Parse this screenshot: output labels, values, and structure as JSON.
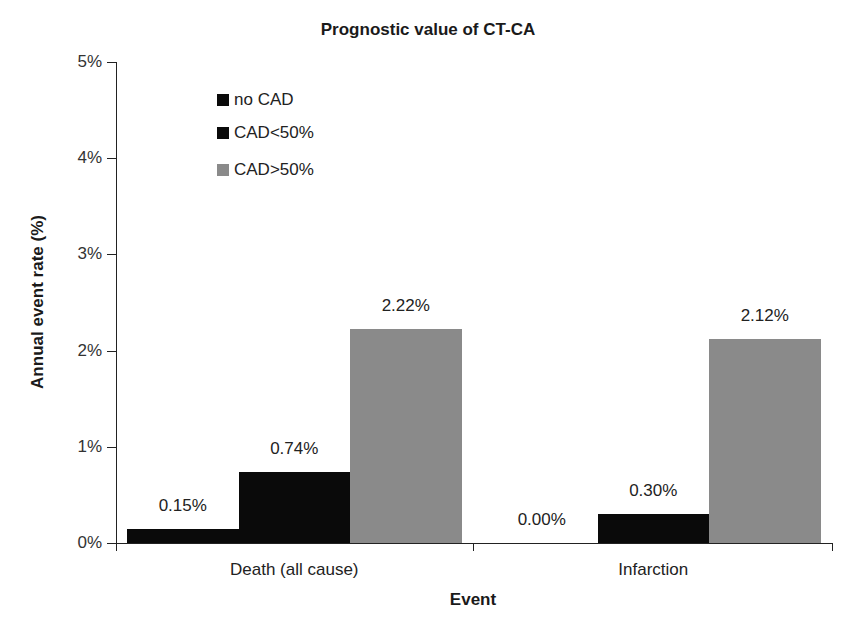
{
  "chart_data": {
    "type": "bar",
    "title": "Prognostic value of CT-CA",
    "xlabel": "Event",
    "ylabel": "Annual event rate (%)",
    "ylim": [
      0,
      5
    ],
    "yticks": [
      "0%",
      "1%",
      "2%",
      "3%",
      "4%",
      "5%"
    ],
    "grid": false,
    "legend_position": "upper-left inside",
    "categories": [
      "Death (all cause)",
      "Infarction"
    ],
    "series": [
      {
        "name": "no CAD",
        "color": "#0a0a0a",
        "values": [
          0.15,
          0.0
        ],
        "labels": [
          "0.15%",
          "0.00%"
        ]
      },
      {
        "name": "CAD<50%",
        "color": "#0a0a0a",
        "values": [
          0.74,
          0.3
        ],
        "labels": [
          "0.74%",
          "0.30%"
        ]
      },
      {
        "name": "CAD>50%",
        "color": "#8a8a8a",
        "values": [
          2.22,
          2.12
        ],
        "labels": [
          "2.22%",
          "2.12%"
        ]
      }
    ]
  }
}
